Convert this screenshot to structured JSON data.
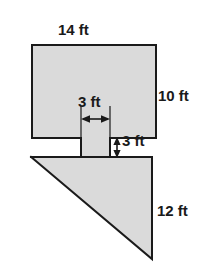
{
  "figure": {
    "kind": "composite-polygon-dimension-diagram",
    "colors": {
      "fill": "#dadada",
      "stroke": "#1a1a1a",
      "background": "#ffffff",
      "text": "#1a1a1a"
    },
    "shape": {
      "outline_name": "composite-shape-outline",
      "points": "32,45 156,45 156,138 110,138 110,157 152,157 152,259 31,157 81,157 81,138 32,138",
      "parts": [
        {
          "name": "top-rectangle",
          "points": "32,45 156,45 156,138 32,138"
        },
        {
          "name": "notch-column",
          "points": "81,138 110,138 110,157 81,157"
        },
        {
          "name": "bottom-triangle",
          "points": "31,157 152,157 152,259"
        }
      ]
    },
    "guides": [
      {
        "name": "notch-left-guide-line",
        "x1": 81,
        "y1": 108,
        "x2": 81,
        "y2": 160
      },
      {
        "name": "notch-right-guide-line",
        "x1": 110,
        "y1": 108,
        "x2": 110,
        "y2": 160
      },
      {
        "name": "depth-top-guide-line",
        "x1": 110,
        "y1": 138,
        "x2": 152,
        "y2": 138
      },
      {
        "name": "depth-bottom-guide-line",
        "x1": 110,
        "y1": 157,
        "x2": 152,
        "y2": 157
      }
    ],
    "arrows": [
      {
        "name": "width-arrow-horizontal",
        "orientation": "horizontal",
        "x1": 81,
        "x2": 110,
        "y": 119
      },
      {
        "name": "depth-arrow-vertical",
        "orientation": "vertical",
        "y1": 138,
        "y2": 157,
        "x": 117
      }
    ],
    "labels": {
      "top_width": "14 ft",
      "right_upper_height": "10 ft",
      "inner_width": "3 ft",
      "inner_depth": "3 ft",
      "right_lower_height": "12 ft"
    }
  }
}
